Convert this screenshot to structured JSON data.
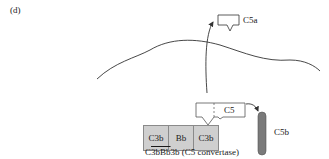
{
  "panel": {
    "label": "(d)"
  },
  "molecules": {
    "c5a": {
      "label": "C5a"
    },
    "c5": {
      "label": "C5"
    },
    "c5b": {
      "label": "C5b"
    },
    "convertase_blocks": [
      {
        "label": "C3b"
      },
      {
        "label": "Bb"
      },
      {
        "label": "C3b"
      }
    ]
  },
  "caption": {
    "prefix": "C",
    "overlined": "3bBb",
    "suffix": "3b (C5 convertase)"
  },
  "colors": {
    "block_fill": "#cfcfcf",
    "block_border": "#8a8a8a",
    "rod_fill": "#7a7a7a",
    "line": "#333333"
  }
}
